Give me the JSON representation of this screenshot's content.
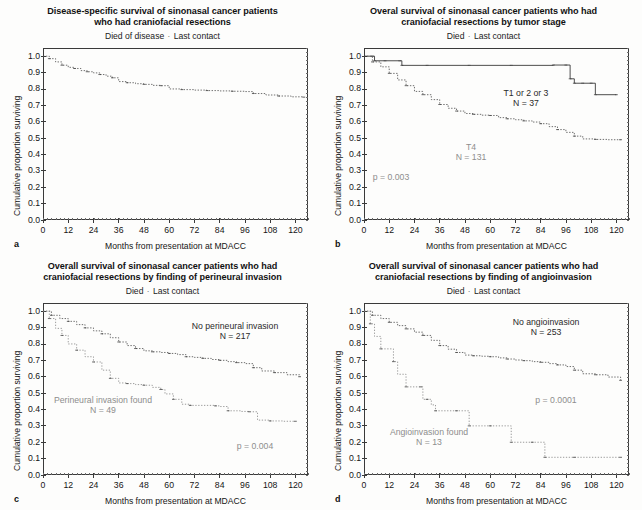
{
  "figure": {
    "axis_x_label": "Months from presentation at MDACC",
    "axis_y_label": "Cumulative proportion surviving",
    "x_ticks": [
      "0",
      "12",
      "24",
      "36",
      "48",
      "60",
      "72",
      "84",
      "96",
      "108",
      "120"
    ],
    "y_ticks": [
      "0.0",
      "0.1",
      "0.2",
      "0.3",
      "0.4",
      "0.5",
      "0.6",
      "0.7",
      "0.8",
      "0.9",
      "1.0"
    ],
    "legend_sep": "·"
  },
  "chart_data": [
    {
      "type": "line",
      "panel": "a",
      "title": "Disease-specific survival of sinonasal cancer patients who had craniofacial resections",
      "title_line1": "Disease-specific survival of sinonasal cancer patients",
      "title_line2": "who had craniofacial resections",
      "legend": [
        "Died of disease",
        "Last contact"
      ],
      "xlabel": "Months from presentation at MDACC",
      "ylabel": "Cumulative proportion surviving",
      "xlim": [
        0,
        126
      ],
      "ylim": [
        0,
        1.05
      ],
      "x_ticks": [
        0,
        12,
        24,
        36,
        48,
        60,
        72,
        84,
        96,
        108,
        120
      ],
      "y_ticks": [
        0.0,
        0.1,
        0.2,
        0.3,
        0.4,
        0.5,
        0.6,
        0.7,
        0.8,
        0.9,
        1.0
      ],
      "grid": false,
      "series": [
        {
          "name": "All patients",
          "style": "dotted",
          "x": [
            0,
            3,
            6,
            9,
            12,
            15,
            18,
            21,
            24,
            27,
            30,
            33,
            36,
            40,
            44,
            48,
            52,
            56,
            60,
            66,
            72,
            78,
            84,
            90,
            96,
            100,
            106,
            112,
            118,
            124
          ],
          "y": [
            1.0,
            0.985,
            0.965,
            0.945,
            0.932,
            0.925,
            0.912,
            0.905,
            0.898,
            0.888,
            0.878,
            0.868,
            0.845,
            0.838,
            0.832,
            0.828,
            0.822,
            0.82,
            0.8,
            0.796,
            0.793,
            0.79,
            0.788,
            0.786,
            0.784,
            0.772,
            0.763,
            0.757,
            0.752,
            0.75
          ]
        }
      ]
    },
    {
      "type": "line",
      "panel": "b",
      "title": "Overal survival of sinonasal cancer patients who had craniofacial resections by tumor stage",
      "title_line1": "Overal survival of sinonasal cancer patients who had",
      "title_line2": "craniofacial resections by tumor stage",
      "legend": [
        "Died",
        "Last contact"
      ],
      "xlabel": "Months from presentation at MDACC",
      "ylabel": "Cumulative proportion surviving",
      "xlim": [
        0,
        126
      ],
      "ylim": [
        0,
        1.05
      ],
      "x_ticks": [
        0,
        12,
        24,
        36,
        48,
        60,
        72,
        84,
        96,
        108,
        120
      ],
      "y_ticks": [
        0.0,
        0.1,
        0.2,
        0.3,
        0.4,
        0.5,
        0.6,
        0.7,
        0.8,
        0.9,
        1.0
      ],
      "grid": false,
      "p_value": "p = 0.003",
      "annotations": [
        {
          "text_line1": "T1 or 2 or 3",
          "text_line2": "N = 37",
          "style": "dark"
        },
        {
          "text_line1": "T4",
          "text_line2": "N = 131",
          "style": "grey"
        }
      ],
      "series": [
        {
          "name": "T1 or 2 or 3",
          "n": 37,
          "style": "solid",
          "x": [
            0,
            4,
            5,
            10,
            17,
            18,
            30,
            50,
            70,
            90,
            96,
            98,
            100,
            104,
            108,
            110,
            120
          ],
          "y": [
            1.0,
            1.0,
            0.972,
            0.972,
            0.972,
            0.944,
            0.944,
            0.944,
            0.944,
            0.946,
            0.946,
            0.862,
            0.835,
            0.835,
            0.835,
            0.765,
            0.765
          ]
        },
        {
          "name": "T4",
          "n": 131,
          "style": "dotted",
          "x": [
            0,
            4,
            8,
            12,
            16,
            20,
            24,
            28,
            32,
            36,
            40,
            44,
            48,
            52,
            56,
            60,
            64,
            68,
            72,
            76,
            80,
            84,
            88,
            92,
            96,
            100,
            104,
            110,
            116,
            122
          ],
          "y": [
            1.0,
            0.965,
            0.935,
            0.895,
            0.855,
            0.82,
            0.785,
            0.765,
            0.735,
            0.705,
            0.682,
            0.665,
            0.65,
            0.645,
            0.64,
            0.638,
            0.625,
            0.618,
            0.612,
            0.605,
            0.598,
            0.588,
            0.57,
            0.552,
            0.535,
            0.512,
            0.495,
            0.492,
            0.49,
            0.49
          ]
        }
      ]
    },
    {
      "type": "line",
      "panel": "c",
      "title": "Overall survival of sinonasal cancer patients who had craniofacial resections by finding of perineural invasion",
      "title_line1": "Overall survival of sinonasal cancer patients who had",
      "title_line2": "craniofacial resections by finding of perineural invasion",
      "legend": [
        "Died",
        "Last contact"
      ],
      "xlabel": "Months from presentation at MDACC",
      "ylabel": "Cumulative proportion surviving",
      "xlim": [
        0,
        126
      ],
      "ylim": [
        0,
        1.05
      ],
      "x_ticks": [
        0,
        12,
        24,
        36,
        48,
        60,
        72,
        84,
        96,
        108,
        120
      ],
      "y_ticks": [
        0.0,
        0.1,
        0.2,
        0.3,
        0.4,
        0.5,
        0.6,
        0.7,
        0.8,
        0.9,
        1.0
      ],
      "grid": false,
      "p_value": "p = 0.004",
      "annotations": [
        {
          "text_line1": "No perineural invasion",
          "text_line2": "N = 217",
          "style": "dark"
        },
        {
          "text_line1": "Perineural invasion found",
          "text_line2": "N = 49",
          "style": "grey"
        }
      ],
      "series": [
        {
          "name": "No perineural invasion",
          "n": 217,
          "style": "dotted",
          "x": [
            0,
            4,
            8,
            12,
            16,
            20,
            24,
            28,
            32,
            36,
            40,
            44,
            48,
            52,
            56,
            60,
            64,
            68,
            72,
            76,
            80,
            84,
            88,
            92,
            96,
            100,
            104,
            110,
            116,
            122
          ],
          "y": [
            1.0,
            0.975,
            0.955,
            0.938,
            0.918,
            0.898,
            0.88,
            0.862,
            0.838,
            0.812,
            0.79,
            0.772,
            0.758,
            0.752,
            0.748,
            0.742,
            0.735,
            0.722,
            0.718,
            0.712,
            0.705,
            0.7,
            0.692,
            0.686,
            0.68,
            0.655,
            0.635,
            0.625,
            0.612,
            0.6
          ]
        },
        {
          "name": "Perineural invasion found",
          "n": 49,
          "style": "dotted-light",
          "x": [
            0,
            3,
            6,
            9,
            12,
            16,
            20,
            24,
            28,
            32,
            36,
            40,
            44,
            48,
            52,
            56,
            58,
            62,
            66,
            70,
            76,
            82,
            84,
            88,
            94,
            98,
            102,
            108,
            114,
            120
          ],
          "y": [
            1.0,
            0.955,
            0.895,
            0.852,
            0.8,
            0.762,
            0.722,
            0.69,
            0.64,
            0.59,
            0.562,
            0.558,
            0.552,
            0.548,
            0.535,
            0.522,
            0.495,
            0.462,
            0.432,
            0.425,
            0.425,
            0.422,
            0.418,
            0.392,
            0.388,
            0.386,
            0.335,
            0.33,
            0.328,
            0.328
          ]
        }
      ]
    },
    {
      "type": "line",
      "panel": "d",
      "title": "Overall survival of sinonasal cancer patients who had craniofacial resections by finding of angioinvasion",
      "title_line1": "Overall survival of sinonasal cancer patients who had",
      "title_line2": "craniofacial resections by finding of angioinvasion",
      "legend": [
        "Died",
        "Last contact"
      ],
      "xlabel": "Months from presentation at MDACC",
      "ylabel": "Cumulative proportion surviving",
      "xlim": [
        0,
        126
      ],
      "ylim": [
        0,
        1.05
      ],
      "x_ticks": [
        0,
        12,
        24,
        36,
        48,
        60,
        72,
        84,
        96,
        108,
        120
      ],
      "y_ticks": [
        0.0,
        0.1,
        0.2,
        0.3,
        0.4,
        0.5,
        0.6,
        0.7,
        0.8,
        0.9,
        1.0
      ],
      "grid": false,
      "p_value": "p = 0.0001",
      "annotations": [
        {
          "text_line1": "No angioinvasion",
          "text_line2": "N = 253",
          "style": "dark"
        },
        {
          "text_line1": "Angioinvasion found",
          "text_line2": "N = 13",
          "style": "grey"
        }
      ],
      "series": [
        {
          "name": "No angioinvasion",
          "n": 253,
          "style": "dotted",
          "x": [
            0,
            4,
            8,
            12,
            16,
            20,
            24,
            28,
            32,
            36,
            40,
            44,
            48,
            52,
            56,
            60,
            64,
            68,
            72,
            76,
            80,
            84,
            88,
            92,
            96,
            100,
            104,
            110,
            116,
            122
          ],
          "y": [
            1.0,
            0.975,
            0.955,
            0.932,
            0.912,
            0.892,
            0.872,
            0.852,
            0.822,
            0.79,
            0.768,
            0.748,
            0.732,
            0.728,
            0.725,
            0.722,
            0.715,
            0.708,
            0.702,
            0.698,
            0.692,
            0.688,
            0.68,
            0.672,
            0.662,
            0.64,
            0.618,
            0.612,
            0.598,
            0.578
          ]
        },
        {
          "name": "Angioinvasion found",
          "n": 13,
          "style": "dotted-light",
          "x": [
            0,
            3,
            5,
            8,
            12,
            14,
            16,
            20,
            24,
            27,
            28,
            30,
            32,
            34,
            36,
            44,
            48,
            50,
            52,
            60,
            68,
            70,
            72,
            80,
            84,
            86,
            90,
            100,
            112,
            122
          ],
          "y": [
            1.0,
            0.923,
            0.846,
            0.77,
            0.77,
            0.692,
            0.615,
            0.538,
            0.538,
            0.538,
            0.462,
            0.462,
            0.428,
            0.392,
            0.392,
            0.392,
            0.392,
            0.3,
            0.3,
            0.3,
            0.3,
            0.2,
            0.2,
            0.2,
            0.2,
            0.108,
            0.108,
            0.108,
            0.108,
            0.108
          ]
        }
      ]
    }
  ]
}
